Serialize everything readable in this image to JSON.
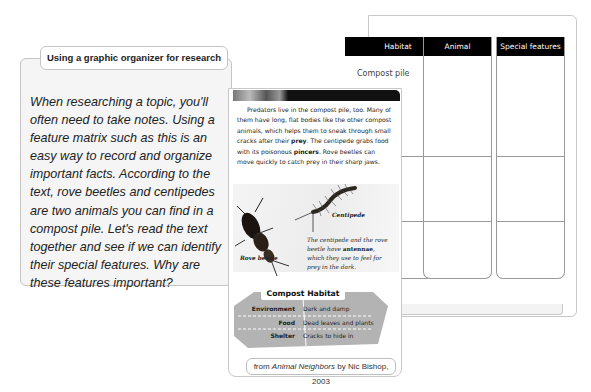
{
  "intro_panel": {
    "title": "Using a graphic organizer for research",
    "body": "When researching a topic, you'll often need to take notes. Using a feature matrix such as this is an easy way to record and organize important facts. According to the text, rove beetles and centipedes are two animals you can find in a compost pile. Let's read the text together and see if we can identify their special features. Why are these features important?"
  },
  "feature_matrix": {
    "columns": [
      "Habitat",
      "Animal",
      "Special features"
    ],
    "rows": [
      [
        "Compost pile",
        "",
        ""
      ],
      [
        "",
        "",
        ""
      ],
      [
        "",
        "",
        ""
      ]
    ]
  },
  "book_page": {
    "paragraph_parts": [
      "Predators live in the compost pile, too. Many of them have long, flat bodies like the other compost animals, which helps them to sneak through small cracks after their ",
      "prey",
      ". The centipede grabs food with its poisonous ",
      "pincers",
      ". Rove beetles can move quickly to catch prey in their sharp jaws."
    ],
    "photo_labels": {
      "rove_beetle": "Rove beetle",
      "centipede": "Centipede"
    },
    "photo_caption_parts": [
      "The centipede and the rove beetle have ",
      "antennae",
      ", which they use to feel for prey in the dark."
    ],
    "habitat_table": {
      "title": "Compost Habitat",
      "rows": [
        {
          "label": "Environment",
          "value": "Dark and damp"
        },
        {
          "label": "Food",
          "value": "Dead leaves and plants"
        },
        {
          "label": "Shelter",
          "value": "Cracks to hide in"
        }
      ]
    }
  },
  "source": {
    "prefix": "from ",
    "title": "Animal Neighbors",
    "suffix": " by Nic Bishop, 2003"
  },
  "colors": {
    "column_header_bg": "#000000",
    "panel_bg": "#f5f5f5",
    "habitat_panel_bg": "#b3b3b3"
  }
}
